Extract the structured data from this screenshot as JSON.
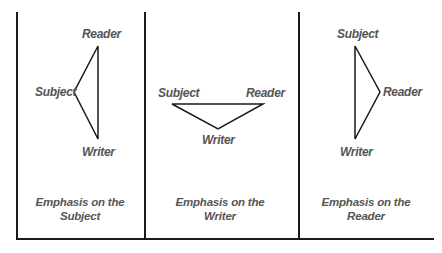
{
  "diagram": {
    "panels": [
      {
        "id": "subject",
        "labels": {
          "top": "Reader",
          "vertex": "Subject",
          "bottom": "Writer"
        },
        "caption_line1": "Emphasis on the",
        "caption_line2": "Subject"
      },
      {
        "id": "writer",
        "labels": {
          "left": "Subject",
          "right": "Reader",
          "vertex": "Writer"
        },
        "caption_line1": "Emphasis on the",
        "caption_line2": "Writer"
      },
      {
        "id": "reader",
        "labels": {
          "top": "Subject",
          "vertex": "Reader",
          "bottom": "Writer"
        },
        "caption_line1": "Emphasis on the",
        "caption_line2": "Reader"
      }
    ],
    "colors": {
      "text": "#555555",
      "lines": "#1a1a1a",
      "background": "#ffffff"
    }
  }
}
